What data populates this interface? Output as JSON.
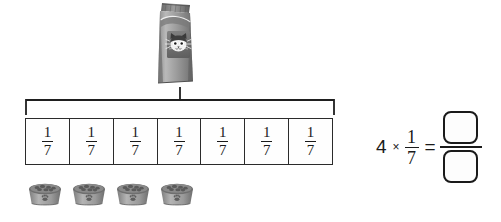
{
  "worksheet": {
    "background_color": "#ffffff",
    "line_color": "#2b2b2b"
  },
  "bag": {
    "icon": "cat-food-bag-icon",
    "description": "Bag of cat food with cat face illustration"
  },
  "bracket": {
    "icon": "brace-bracket-icon",
    "description": "Bracket spanning the whole fraction bar, pointing up to the bag"
  },
  "fraction_bar": {
    "total_parts": 7,
    "cells": [
      {
        "numerator": "1",
        "denominator": "7"
      },
      {
        "numerator": "1",
        "denominator": "7"
      },
      {
        "numerator": "1",
        "denominator": "7"
      },
      {
        "numerator": "1",
        "denominator": "7"
      },
      {
        "numerator": "1",
        "denominator": "7"
      },
      {
        "numerator": "1",
        "denominator": "7"
      },
      {
        "numerator": "1",
        "denominator": "7"
      }
    ]
  },
  "bowls": {
    "count": 4,
    "icon": "pet-food-bowl-icon",
    "description": "Pet food bowls filled with kibble, paw print on the side"
  },
  "equation": {
    "multiplier": "4",
    "times_symbol": "×",
    "fraction": {
      "numerator": "1",
      "denominator": "7"
    },
    "equals_symbol": "=",
    "answer": {
      "numerator": "",
      "denominator": ""
    }
  }
}
